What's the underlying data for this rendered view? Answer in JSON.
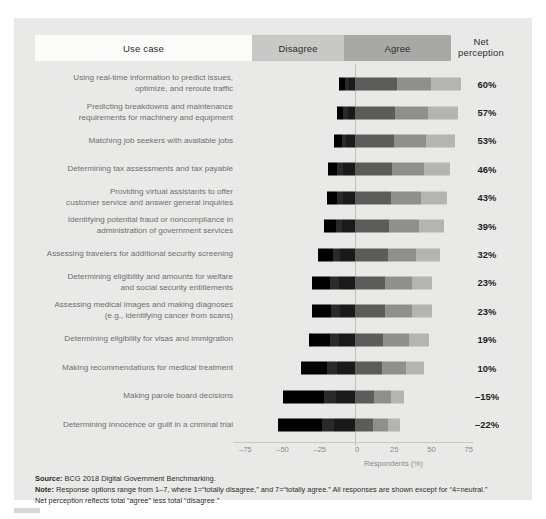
{
  "header": {
    "use_case": "Use case",
    "disagree": "Disagree",
    "agree": "Agree",
    "net_line1": "Net",
    "net_line2": "perception"
  },
  "axis": {
    "title": "Respondents (%)",
    "ticks": [
      "–75",
      "–50",
      "–25",
      "0",
      "25",
      "50",
      "75"
    ],
    "tick_values": [
      -75,
      -50,
      -25,
      0,
      25,
      50,
      75
    ],
    "min": -80,
    "max": 80
  },
  "footer": {
    "source_label": "Source:",
    "source_text": " BCG 2018 Digital Government Benchmarking.",
    "note_label": "Note:",
    "note_text": " Response options range from 1–7, where 1=“totally disagree,” and 7=“totally agree.” All responses are shown except for “4=neutral.”",
    "note_text2": "Net perception reflects total “agree” less total “disagree.”"
  },
  "colors": {
    "figure_background": "#e9e9e7",
    "header_usecase": "#fbfbfa",
    "header_disagree": "#c8c8c6",
    "header_agree": "#a8a8a6",
    "zero_line": "#c0c0bd",
    "disagree_1": "#000000",
    "disagree_2": "#2a2a2a",
    "disagree_3": "#1a1a1a",
    "agree_5": "#5c5c5a",
    "agree_6": "#8f8f8d",
    "agree_7": "#b4b4b2",
    "label_text": "#6f6f6f",
    "net_text": "#1d1d1d"
  },
  "chart_data": {
    "type": "bar",
    "subtype": "diverging-stacked-bar",
    "title": "",
    "xlabel": "Respondents (%)",
    "ylabel": "",
    "xlim": [
      -80,
      80
    ],
    "grid": false,
    "legend_position": "top",
    "series": [
      {
        "name": "Totally disagree (1)",
        "color": "#000000",
        "side": "negative"
      },
      {
        "name": "Disagree (2)",
        "color": "#2a2a2a",
        "side": "negative"
      },
      {
        "name": "Somewhat disagree (3)",
        "color": "#1a1a1a",
        "side": "negative"
      },
      {
        "name": "Somewhat agree (5)",
        "color": "#5c5c5a",
        "side": "positive"
      },
      {
        "name": "Agree (6)",
        "color": "#8f8f8d",
        "side": "positive"
      },
      {
        "name": "Totally agree (7)",
        "color": "#b4b4b2",
        "side": "positive"
      }
    ],
    "categories": [
      "Using real-time information to predict issues, optimize, and reroute traffic",
      "Predicting breakdowns and maintenance requirements for machinery and equipment",
      "Matching job seekers with available jobs",
      "Determining tax assessments and tax payable",
      "Providing virtual assistants to offer customer service and answer general inquiries",
      "Identifying potential fraud or noncompliance in administration of government services",
      "Assessing travelers for additional security screening",
      "Determining eligibility and amounts for welfare and social security entitlements",
      "Assessing medical images and making diagnoses (e.g., identifying cancer from scans)",
      "Determining eligibility for visas and immigration",
      "Making recommendations for medical treatment",
      "Making parole board decisions",
      "Determining innocence or guilt in a criminal trial"
    ],
    "rows": [
      {
        "label_lines": [
          "Using real-time information to predict issues,",
          "optimize, and reroute traffic"
        ],
        "net": "60%",
        "net_value": 60,
        "disagree_total": 11,
        "agree_total": 71,
        "negative_segments": [
          4,
          3,
          4
        ],
        "positive_segments": [
          28,
          23,
          20
        ]
      },
      {
        "label_lines": [
          "Predicting breakdowns and maintenance",
          "requirements for machinery and equipment"
        ],
        "net": "57%",
        "net_value": 57,
        "disagree_total": 12,
        "agree_total": 69,
        "negative_segments": [
          4,
          3,
          5
        ],
        "positive_segments": [
          27,
          22,
          20
        ]
      },
      {
        "label_lines": [
          "Matching job seekers with available jobs"
        ],
        "net": "53%",
        "net_value": 53,
        "disagree_total": 14,
        "agree_total": 67,
        "negative_segments": [
          5,
          3,
          6
        ],
        "positive_segments": [
          26,
          22,
          19
        ]
      },
      {
        "label_lines": [
          "Determining tax assessments and tax payable"
        ],
        "net": "46%",
        "net_value": 46,
        "disagree_total": 18,
        "agree_total": 64,
        "negative_segments": [
          6,
          4,
          8
        ],
        "positive_segments": [
          25,
          21,
          18
        ]
      },
      {
        "label_lines": [
          "Providing virtual assistants to offer",
          "customer service and answer general inquiries"
        ],
        "net": "43%",
        "net_value": 43,
        "disagree_total": 19,
        "agree_total": 62,
        "negative_segments": [
          7,
          4,
          8
        ],
        "positive_segments": [
          24,
          20,
          18
        ]
      },
      {
        "label_lines": [
          "Identifying potential fraud or noncompliance in",
          "administration of government services"
        ],
        "net": "39%",
        "net_value": 39,
        "disagree_total": 21,
        "agree_total": 60,
        "negative_segments": [
          8,
          4,
          9
        ],
        "positive_segments": [
          23,
          20,
          17
        ]
      },
      {
        "label_lines": [
          "Assessing travelers for additional security screening"
        ],
        "net": "32%",
        "net_value": 32,
        "disagree_total": 25,
        "agree_total": 57,
        "negative_segments": [
          10,
          5,
          10
        ],
        "positive_segments": [
          22,
          19,
          16
        ]
      },
      {
        "label_lines": [
          "Determining eligibility and amounts for welfare",
          "and social security entitlements"
        ],
        "net": "23%",
        "net_value": 23,
        "disagree_total": 29,
        "agree_total": 52,
        "negative_segments": [
          12,
          6,
          11
        ],
        "positive_segments": [
          20,
          18,
          14
        ]
      },
      {
        "label_lines": [
          "Assessing medical images and making diagnoses",
          "(e.g., identifying cancer from scans)"
        ],
        "net": "23%",
        "net_value": 23,
        "disagree_total": 29,
        "agree_total": 52,
        "negative_segments": [
          13,
          6,
          10
        ],
        "positive_segments": [
          20,
          18,
          14
        ]
      },
      {
        "label_lines": [
          "Determining eligibility for visas and immigration"
        ],
        "net": "19%",
        "net_value": 19,
        "disagree_total": 31,
        "agree_total": 50,
        "negative_segments": [
          14,
          6,
          11
        ],
        "positive_segments": [
          19,
          17,
          14
        ]
      },
      {
        "label_lines": [
          "Making recommendations for medical treatment"
        ],
        "net": "10%",
        "net_value": 10,
        "disagree_total": 36,
        "agree_total": 46,
        "negative_segments": [
          17,
          7,
          12
        ],
        "positive_segments": [
          18,
          16,
          12
        ]
      },
      {
        "label_lines": [
          "Making parole board decisions"
        ],
        "net": "–15%",
        "net_value": -15,
        "disagree_total": 48,
        "agree_total": 33,
        "negative_segments": [
          27,
          8,
          13
        ],
        "positive_segments": [
          13,
          11,
          9
        ]
      },
      {
        "label_lines": [
          "Determining innocence or guilt in a criminal trial"
        ],
        "net": "–22%",
        "net_value": -22,
        "disagree_total": 52,
        "agree_total": 30,
        "negative_segments": [
          30,
          8,
          14
        ],
        "positive_segments": [
          12,
          10,
          8
        ]
      }
    ]
  }
}
